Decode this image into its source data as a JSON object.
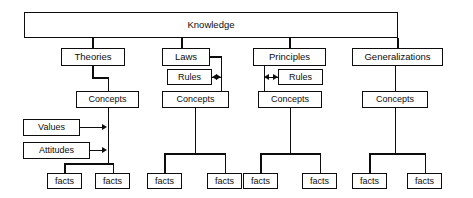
{
  "diagram": {
    "title": "Knowledge",
    "type": "hierarchy-tree",
    "root": {
      "label": "Knowledge"
    },
    "branches": [
      {
        "id": "theories",
        "label": "Theories",
        "concepts_label": "Concepts",
        "facts": [
          "facts",
          "facts"
        ],
        "side_inputs": [
          {
            "id": "values",
            "label": "Values"
          },
          {
            "id": "attitudes",
            "label": "Attitudes"
          }
        ]
      },
      {
        "id": "laws",
        "label": "Laws",
        "rules_label": "Rules",
        "concepts_label": "Concepts",
        "facts": [
          "facts",
          "facts"
        ]
      },
      {
        "id": "principles",
        "label": "Principles",
        "rules_label": "Rules",
        "concepts_label": "Concepts",
        "facts": [
          "facts",
          "facts"
        ]
      },
      {
        "id": "generalizations",
        "label": "Generalizations",
        "concepts_label": "Concepts",
        "facts": [
          "facts",
          "facts"
        ]
      }
    ],
    "colors": {
      "line": "#0d0d0d",
      "box_fill": "#ffffff",
      "text": "#0d0d0d",
      "background": "#ffffff"
    }
  }
}
